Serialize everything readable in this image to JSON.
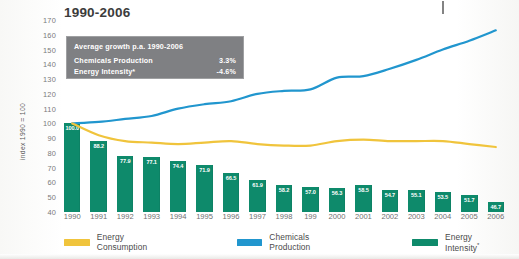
{
  "title": "1990-2006",
  "axis": {
    "ylabel": "index 1990 = 100",
    "yticks": [
      170,
      160,
      150,
      140,
      130,
      120,
      110,
      100,
      90,
      80,
      70,
      60,
      50,
      40
    ]
  },
  "callout": {
    "heading": "Average growth p.a. 1990-2006",
    "rows": [
      {
        "label": "Chemicals Production",
        "value": "3.3%"
      },
      {
        "label": "Energy Intensity*",
        "value": "-4.6%"
      }
    ]
  },
  "legend": {
    "items": [
      {
        "label": "Energy Consumption",
        "color": "#F0C43C"
      },
      {
        "label": "Chemicals Production",
        "color": "#2196CE"
      },
      {
        "label": "Energy Intensity*",
        "color": "#0E8A6B"
      }
    ]
  },
  "colors": {
    "energy_consumption": "#F0C43C",
    "chemicals_production": "#2196CE",
    "energy_intensity": "#0E8A6B",
    "callout_bg": "#7f8083",
    "text": "#4b4b4b"
  },
  "chart_data": {
    "type": "bar",
    "title": "1990-2006",
    "xlabel": "",
    "ylabel": "index 1990 = 100",
    "ylim": [
      40,
      170
    ],
    "grid": false,
    "legend_position": "bottom",
    "categories": [
      "1990",
      "1991",
      "1992",
      "1993",
      "1994",
      "1995",
      "1996",
      "1997",
      "1998",
      "199",
      "2000",
      "2001",
      "2002",
      "2003",
      "2004",
      "2005",
      "2006"
    ],
    "series": [
      {
        "name": "Energy Intensity*",
        "type": "bar",
        "color": "#0E8A6B",
        "labels": [
          "100.0",
          "88.2",
          "77.9",
          "77.1",
          "74.4",
          "71.9",
          "66.5",
          "61.9",
          "58.2",
          "57.0",
          "56.3",
          "58.5",
          "54.7",
          "55.1",
          "53.5",
          "51.7",
          "46.7"
        ],
        "values": [
          100.0,
          88.2,
          77.9,
          77.1,
          74.4,
          71.9,
          66.5,
          61.9,
          58.2,
          57.0,
          56.3,
          58.5,
          54.7,
          55.1,
          53.5,
          51.7,
          46.7
        ]
      },
      {
        "name": "Chemicals Production",
        "type": "line",
        "color": "#2196CE",
        "values": [
          100,
          101,
          103,
          105,
          110,
          113,
          115,
          120,
          122,
          123,
          131,
          132,
          137,
          143,
          150,
          156,
          163
        ]
      },
      {
        "name": "Energy Consumption",
        "type": "line",
        "color": "#F0C43C",
        "values": [
          100,
          92,
          88,
          87,
          86,
          87,
          88,
          86,
          85,
          85,
          88,
          89,
          88,
          88,
          88,
          86,
          84
        ]
      }
    ]
  }
}
